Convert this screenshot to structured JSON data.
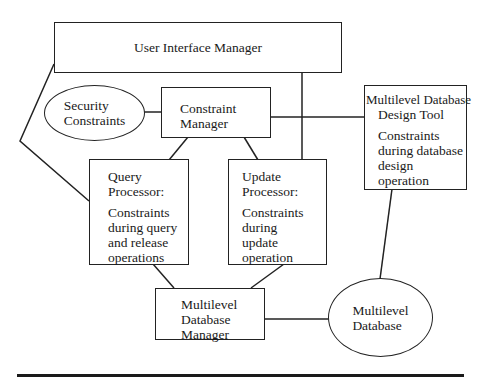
{
  "diagram": {
    "nodes": {
      "user_interface_manager": {
        "label": "User Interface Manager",
        "shape": "rectangle"
      },
      "security_constraints": {
        "lines": [
          "Security",
          "Constraints"
        ],
        "shape": "ellipse"
      },
      "constraint_manager": {
        "lines": [
          "Constraint",
          "Manager"
        ],
        "shape": "rectangle"
      },
      "design_tool": {
        "title_lines": [
          "Multilevel Database",
          "Design Tool"
        ],
        "desc_lines": [
          "Constraints",
          "during database",
          "design",
          "operation"
        ],
        "shape": "rectangle"
      },
      "query_processor": {
        "title_lines": [
          "Query",
          "Processor:"
        ],
        "desc_lines": [
          "Constraints",
          "during query",
          "and release",
          "operations"
        ],
        "shape": "rectangle"
      },
      "update_processor": {
        "title_lines": [
          "Update",
          "Processor:"
        ],
        "desc_lines": [
          "Constraints",
          "during",
          "update",
          "operation"
        ],
        "shape": "rectangle"
      },
      "database_manager": {
        "lines": [
          "Multilevel",
          "Database",
          "Manager"
        ],
        "shape": "rectangle"
      },
      "multilevel_database": {
        "lines": [
          "Multilevel",
          "Database"
        ],
        "shape": "ellipse"
      }
    },
    "edges": [
      {
        "from": "user_interface_manager",
        "to": "query_processor"
      },
      {
        "from": "user_interface_manager",
        "to": "update_processor"
      },
      {
        "from": "security_constraints",
        "to": "constraint_manager"
      },
      {
        "from": "constraint_manager",
        "to": "design_tool"
      },
      {
        "from": "constraint_manager",
        "to": "query_processor"
      },
      {
        "from": "constraint_manager",
        "to": "update_processor"
      },
      {
        "from": "query_processor",
        "to": "database_manager"
      },
      {
        "from": "update_processor",
        "to": "database_manager"
      },
      {
        "from": "database_manager",
        "to": "multilevel_database"
      },
      {
        "from": "design_tool",
        "to": "multilevel_database"
      }
    ],
    "colors": {
      "stroke": "#222222",
      "background": "#ffffff"
    }
  }
}
